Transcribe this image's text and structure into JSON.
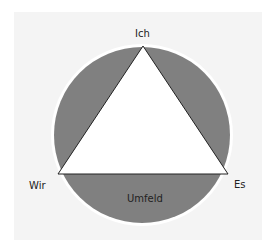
{
  "diagram": {
    "title": "",
    "labels": {
      "top": "Ich",
      "left": "Wir",
      "right": "Es",
      "bottom": "Umfeld"
    },
    "colors": {
      "background": "#f4f4f4",
      "circle_fill": "#808080",
      "circle_outline": "#ffffff",
      "triangle_fill": "#ffffff",
      "triangle_stroke": "#222222"
    }
  }
}
